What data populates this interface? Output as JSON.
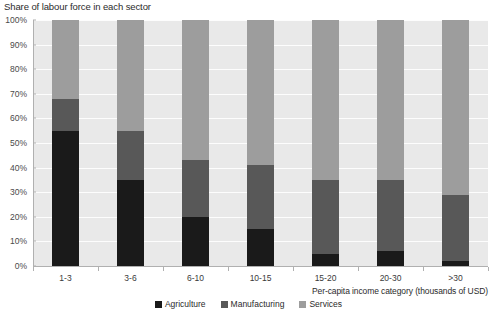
{
  "chart_data": {
    "type": "bar",
    "subtype": "stacked-100-percent",
    "title": "Share of labour force in each sector",
    "xlabel": "Per-capita income category (thousands of USD)",
    "ylabel": "",
    "categories": [
      "1-3",
      "3-6",
      "6-10",
      "10-15",
      "15-20",
      "20-30",
      ">30"
    ],
    "series": [
      {
        "name": "Agriculture",
        "color": "#1a1a1a",
        "values": [
          55,
          35,
          20,
          15,
          5,
          6,
          2
        ]
      },
      {
        "name": "Manufacturing",
        "color": "#585858",
        "values": [
          13,
          20,
          23,
          26,
          30,
          29,
          27
        ]
      },
      {
        "name": "Services",
        "color": "#9d9d9d",
        "values": [
          32,
          45,
          57,
          59,
          65,
          65,
          71
        ]
      }
    ],
    "ylim": [
      0,
      100
    ],
    "yticks": [
      0,
      10,
      20,
      30,
      40,
      50,
      60,
      70,
      80,
      90,
      100
    ],
    "ytick_labels": [
      "0%",
      "10%",
      "20%",
      "30%",
      "40%",
      "50%",
      "60%",
      "70%",
      "80%",
      "90%",
      "100%"
    ],
    "grid": true,
    "grid_color": "#fdfdfd",
    "plot_background": "#e9e9e9",
    "legend_position": "bottom"
  }
}
